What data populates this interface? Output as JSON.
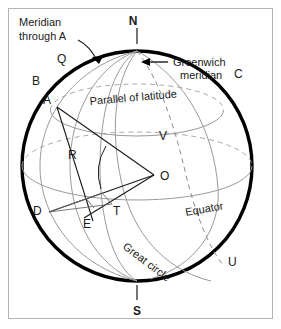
{
  "figure": {
    "background_color": "#ffffff",
    "border_color": "#b4b4b4",
    "sphere_outline_color": "#000000",
    "grid_line_color": "#8c8c8c",
    "construction_line_color": "#1a1a1a",
    "dashed_line_color": "#8c8c8c"
  },
  "poles": {
    "north": "N",
    "south": "S"
  },
  "points": {
    "q": "Q",
    "b": "B",
    "c": "C",
    "a": "A",
    "v": "V",
    "r": "R",
    "o": "O",
    "d": "D",
    "e": "E",
    "t": "T",
    "u": "U"
  },
  "annotations": {
    "meridian_through_a_line1": "Meridian",
    "meridian_through_a_line2": "through A",
    "greenwich_line1": "Greenwich",
    "greenwich_line2": "meridian",
    "parallel_of_latitude": "Parallel of latitude",
    "equator": "Equator",
    "great_circle": "Great circle"
  }
}
